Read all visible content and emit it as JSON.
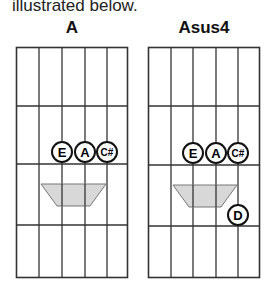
{
  "intro_text": "illustrated below.",
  "diagrams": [
    {
      "title": "A",
      "notes": [
        {
          "label": "E",
          "string": 2,
          "fret": 2
        },
        {
          "label": "A",
          "string": 3,
          "fret": 2
        },
        {
          "label": "C#",
          "string": 4,
          "fret": 2
        }
      ],
      "barre_shape": "trapezoid"
    },
    {
      "title": "Asus4",
      "notes": [
        {
          "label": "E",
          "string": 2,
          "fret": 2
        },
        {
          "label": "A",
          "string": 3,
          "fret": 2
        },
        {
          "label": "C#",
          "string": 4,
          "fret": 2
        },
        {
          "label": "D",
          "string": 4,
          "fret": 3
        }
      ],
      "barre_shape": "trapezoid"
    }
  ],
  "colors": {
    "grid": "#333333",
    "shape_fill": "#d8d8d8",
    "shape_stroke": "#777777"
  }
}
